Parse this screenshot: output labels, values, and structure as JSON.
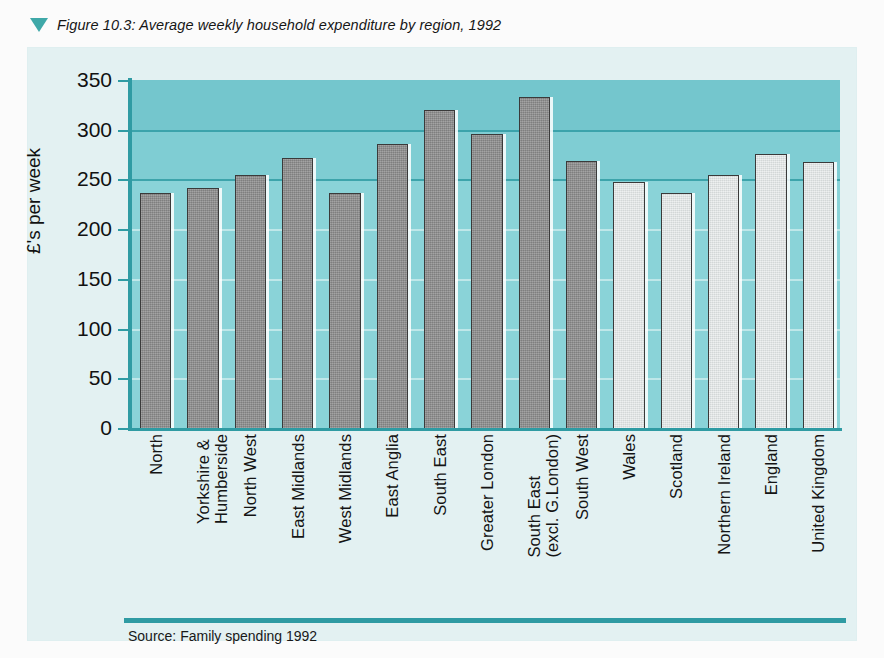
{
  "figure": {
    "marker_icon": "triangle-down-icon",
    "caption": "Figure 10.3: Average weekly household expenditure by region, 1992",
    "source": "Source: Family spending 1992"
  },
  "colors": {
    "accent_teal": "#2f9ba3",
    "plot_background": "#7fcdd3",
    "panel_background": "#e3f1f2",
    "bar_dark": "#8e8e8e",
    "bar_light": "#e2e6e6",
    "gridline": "#ffffff"
  },
  "chart_data": {
    "type": "bar",
    "title": "Figure 10.3: Average weekly household expenditure by region, 1992",
    "xlabel": "",
    "ylabel": "£'s per week",
    "ylim": [
      0,
      350
    ],
    "yticks": [
      0,
      50,
      100,
      150,
      200,
      250,
      300,
      350
    ],
    "ytick_labels": [
      "0",
      "50",
      "100",
      "150",
      "200",
      "250",
      "300",
      "350"
    ],
    "grid": true,
    "legend": null,
    "categories": [
      "North",
      "Yorkshire &\nHumberside",
      "North West",
      "East Midlands",
      "West Midlands",
      "East Anglia",
      "South East",
      "Greater London",
      "South East\n(excl. G.London)",
      "South West",
      "Wales",
      "Scotland",
      "Northern Ireland",
      "England",
      "United Kingdom"
    ],
    "values": [
      236,
      241,
      254,
      272,
      236,
      286,
      320,
      296,
      333,
      269,
      247,
      236,
      254,
      276,
      268
    ],
    "bar_styles": [
      "dark",
      "dark",
      "dark",
      "dark",
      "dark",
      "dark",
      "dark",
      "dark",
      "dark",
      "dark",
      "light",
      "light",
      "light",
      "light",
      "light"
    ]
  }
}
